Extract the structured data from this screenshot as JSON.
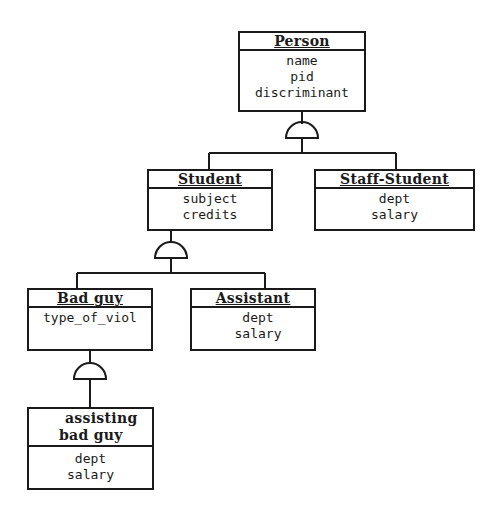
{
  "diagram": {
    "type": "generalization-hierarchy",
    "line_color": "#1a1a1a",
    "classes": [
      {
        "id": "person",
        "name": "Person",
        "attributes": [
          "name",
          "pid",
          "discriminant"
        ]
      },
      {
        "id": "student",
        "name": "Student",
        "attributes": [
          "subject",
          "credits"
        ]
      },
      {
        "id": "staff_student",
        "name": "Staff-Student",
        "attributes": [
          "dept",
          "salary"
        ]
      },
      {
        "id": "bad_guy",
        "name": "Bad guy",
        "attributes": [
          "type_of_viol"
        ]
      },
      {
        "id": "assistant",
        "name": "Assistant",
        "attributes": [
          "dept",
          "salary"
        ]
      },
      {
        "id": "assisting_bad_guy",
        "name_lines": [
          "assisting",
          "bad guy"
        ],
        "attributes": [
          "dept",
          "salary"
        ]
      }
    ],
    "generalizations": [
      {
        "parent": "Person",
        "children": [
          "Student",
          "Staff-Student"
        ]
      },
      {
        "parent": "Student",
        "children": [
          "Bad guy",
          "Assistant"
        ]
      },
      {
        "parent": "Bad guy",
        "children": [
          "assisting bad guy"
        ]
      }
    ]
  }
}
